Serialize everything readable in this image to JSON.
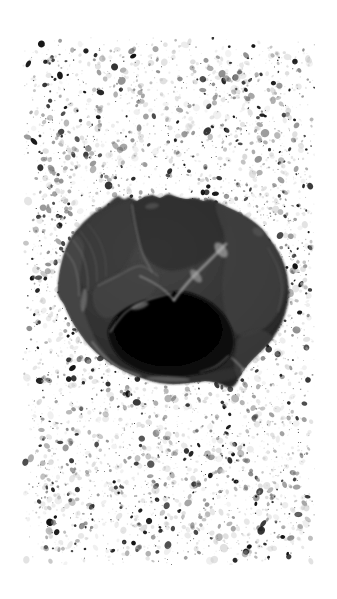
{
  "plate": {
    "kind": "scanned-photographic-plate",
    "subject": "lithic artifact",
    "caption": "",
    "title": "",
    "width": 337,
    "height": 599,
    "orientation": "portrait"
  },
  "page": {
    "background_color": "#ffffff",
    "margin_left": 22,
    "margin_top": 37,
    "margin_right": 22,
    "margin_bottom": 34
  },
  "noise": {
    "name": "scan-speckle-field",
    "x": 22,
    "y": 37,
    "width": 293,
    "height": 528,
    "seed": 20240517,
    "speck_count": 5200,
    "min_size": 0.5,
    "max_size": 3.2,
    "dark_color": "#111111",
    "mid_color": "#6a6a6a",
    "light_color": "#bdbdbd",
    "dark_fraction": 0.17,
    "mid_fraction": 0.33,
    "clump_count": 70,
    "clump_spread": 3.0,
    "clump_specks": 5
  },
  "artifact": {
    "name": "stone-core-artifact",
    "description": "dark rounded lithic core with flake scars and a deep shadowed cavity",
    "bbox": {
      "x": 58,
      "y": 194,
      "width": 232,
      "height": 196
    },
    "center": {
      "x": 174,
      "y": 292
    },
    "body_color": "#2b2b2b",
    "body_mid_color": "#3d3d3d",
    "body_light_color": "#6d6d6d",
    "highlight_color": "#a8a8a8",
    "cavity_color": "#080808",
    "edge_color": "#1a1a1a",
    "grain_seed": 771,
    "grain_count": 9000,
    "outline": [
      [
        58,
        292
      ],
      [
        59,
        276
      ],
      [
        62,
        261
      ],
      [
        66,
        248
      ],
      [
        72,
        236
      ],
      [
        80,
        226
      ],
      [
        88,
        218
      ],
      [
        97,
        211
      ],
      [
        105,
        206
      ],
      [
        112,
        200
      ],
      [
        118,
        196
      ],
      [
        124,
        199
      ],
      [
        130,
        197
      ],
      [
        137,
        201
      ],
      [
        144,
        197
      ],
      [
        152,
        195
      ],
      [
        160,
        198
      ],
      [
        168,
        194
      ],
      [
        177,
        197
      ],
      [
        186,
        199
      ],
      [
        195,
        198
      ],
      [
        203,
        201
      ],
      [
        211,
        199
      ],
      [
        219,
        203
      ],
      [
        227,
        207
      ],
      [
        236,
        211
      ],
      [
        245,
        216
      ],
      [
        254,
        222
      ],
      [
        262,
        229
      ],
      [
        269,
        238
      ],
      [
        276,
        248
      ],
      [
        282,
        259
      ],
      [
        286,
        270
      ],
      [
        288,
        281
      ],
      [
        289,
        292
      ],
      [
        288,
        303
      ],
      [
        285,
        314
      ],
      [
        281,
        325
      ],
      [
        275,
        335
      ],
      [
        268,
        344
      ],
      [
        260,
        352
      ],
      [
        252,
        360
      ],
      [
        245,
        368
      ],
      [
        240,
        376
      ],
      [
        236,
        384
      ],
      [
        230,
        388
      ],
      [
        222,
        385
      ],
      [
        214,
        382
      ],
      [
        205,
        381
      ],
      [
        196,
        382
      ],
      [
        187,
        383
      ],
      [
        178,
        384
      ],
      [
        169,
        384
      ],
      [
        160,
        383
      ],
      [
        151,
        381
      ],
      [
        142,
        378
      ],
      [
        133,
        375
      ],
      [
        124,
        371
      ],
      [
        115,
        366
      ],
      [
        106,
        360
      ],
      [
        97,
        353
      ],
      [
        89,
        345
      ],
      [
        82,
        336
      ],
      [
        75,
        326
      ],
      [
        69,
        315
      ],
      [
        64,
        304
      ],
      [
        60,
        298
      ]
    ],
    "cavity": [
      [
        108,
        330
      ],
      [
        115,
        317
      ],
      [
        126,
        308
      ],
      [
        139,
        302
      ],
      [
        152,
        298
      ],
      [
        164,
        294
      ],
      [
        176,
        291
      ],
      [
        188,
        292
      ],
      [
        199,
        296
      ],
      [
        209,
        301
      ],
      [
        218,
        308
      ],
      [
        225,
        316
      ],
      [
        230,
        325
      ],
      [
        233,
        334
      ],
      [
        234,
        343
      ],
      [
        232,
        352
      ],
      [
        227,
        360
      ],
      [
        220,
        366
      ],
      [
        211,
        371
      ],
      [
        200,
        374
      ],
      [
        188,
        376
      ],
      [
        176,
        377
      ],
      [
        164,
        376
      ],
      [
        152,
        374
      ],
      [
        141,
        371
      ],
      [
        131,
        366
      ],
      [
        122,
        360
      ],
      [
        115,
        352
      ],
      [
        110,
        342
      ]
    ],
    "facets": [
      {
        "name": "upper-left-facet",
        "tone": "#3a3a3a",
        "points": [
          [
            68,
            250
          ],
          [
            86,
            223
          ],
          [
            110,
            207
          ],
          [
            132,
            202
          ],
          [
            140,
            222
          ],
          [
            134,
            248
          ],
          [
            120,
            272
          ],
          [
            100,
            288
          ],
          [
            80,
            284
          ],
          [
            70,
            268
          ]
        ]
      },
      {
        "name": "upper-central-facet",
        "tone": "#2e2e2e",
        "points": [
          [
            133,
            202
          ],
          [
            160,
            196
          ],
          [
            190,
            198
          ],
          [
            216,
            204
          ],
          [
            228,
            224
          ],
          [
            216,
            250
          ],
          [
            192,
            266
          ],
          [
            166,
            270
          ],
          [
            145,
            256
          ],
          [
            136,
            230
          ]
        ]
      },
      {
        "name": "upper-right-facet",
        "tone": "#3f3f3f",
        "points": [
          [
            216,
            204
          ],
          [
            244,
            216
          ],
          [
            266,
            234
          ],
          [
            280,
            258
          ],
          [
            286,
            284
          ],
          [
            280,
            310
          ],
          [
            262,
            330
          ],
          [
            240,
            336
          ],
          [
            226,
            316
          ],
          [
            222,
            284
          ],
          [
            226,
            244
          ]
        ]
      },
      {
        "name": "left-margin-facet",
        "tone": "#4a4a4a",
        "points": [
          [
            58,
            292
          ],
          [
            62,
            262
          ],
          [
            74,
            236
          ],
          [
            84,
            246
          ],
          [
            80,
            278
          ],
          [
            84,
            310
          ],
          [
            96,
            340
          ],
          [
            110,
            360
          ],
          [
            96,
            356
          ],
          [
            78,
            334
          ],
          [
            64,
            310
          ]
        ]
      },
      {
        "name": "lower-rim-facet",
        "tone": "#333333",
        "points": [
          [
            100,
            356
          ],
          [
            124,
            372
          ],
          [
            154,
            381
          ],
          [
            186,
            384
          ],
          [
            216,
            383
          ],
          [
            238,
            377
          ],
          [
            246,
            364
          ],
          [
            230,
            368
          ],
          [
            198,
            374
          ],
          [
            162,
            376
          ],
          [
            128,
            370
          ],
          [
            106,
            358
          ]
        ]
      },
      {
        "name": "right-lower-facet",
        "tone": "#3c3c3c",
        "points": [
          [
            240,
            336
          ],
          [
            262,
            330
          ],
          [
            276,
            342
          ],
          [
            268,
            356
          ],
          [
            252,
            366
          ],
          [
            240,
            378
          ],
          [
            234,
            366
          ],
          [
            236,
            350
          ]
        ]
      },
      {
        "name": "central-left-facet",
        "tone": "#454545",
        "points": [
          [
            96,
            286
          ],
          [
            120,
            272
          ],
          [
            142,
            262
          ],
          [
            160,
            274
          ],
          [
            150,
            296
          ],
          [
            126,
            310
          ],
          [
            106,
            318
          ],
          [
            94,
            306
          ]
        ]
      }
    ],
    "ridges": [
      {
        "name": "main-arris",
        "tone": "#a5a5a5",
        "width": 3.0,
        "points": [
          [
            226,
            244
          ],
          [
            208,
            262
          ],
          [
            192,
            278
          ],
          [
            180,
            292
          ],
          [
            174,
            300
          ]
        ]
      },
      {
        "name": "arris-branch",
        "tone": "#8d8d8d",
        "width": 2.0,
        "points": [
          [
            174,
            300
          ],
          [
            164,
            290
          ],
          [
            152,
            282
          ],
          [
            140,
            276
          ]
        ]
      },
      {
        "name": "upper-left-arris",
        "tone": "#7a7a7a",
        "width": 1.6,
        "points": [
          [
            132,
            205
          ],
          [
            136,
            228
          ],
          [
            142,
            252
          ],
          [
            152,
            272
          ]
        ]
      },
      {
        "name": "facet-edge-left",
        "tone": "#6d6d6d",
        "width": 1.4,
        "points": [
          [
            98,
            286
          ],
          [
            118,
            276
          ],
          [
            140,
            266
          ],
          [
            158,
            276
          ]
        ]
      },
      {
        "name": "cavity-upper-edge",
        "tone": "#8a8a8a",
        "width": 1.6,
        "points": [
          [
            110,
            332
          ],
          [
            126,
            312
          ],
          [
            148,
            300
          ],
          [
            172,
            293
          ]
        ]
      },
      {
        "name": "left-scar-1",
        "tone": "#7d7d7d",
        "width": 1.2,
        "points": [
          [
            66,
            252
          ],
          [
            74,
            264
          ],
          [
            78,
            280
          ],
          [
            79,
            296
          ]
        ]
      },
      {
        "name": "left-scar-2",
        "tone": "#707070",
        "width": 1.2,
        "points": [
          [
            73,
            240
          ],
          [
            82,
            254
          ],
          [
            87,
            272
          ],
          [
            88,
            290
          ]
        ]
      },
      {
        "name": "left-scar-3",
        "tone": "#6a6a6a",
        "width": 1.0,
        "points": [
          [
            80,
            231
          ],
          [
            90,
            246
          ],
          [
            96,
            264
          ],
          [
            97,
            282
          ]
        ]
      },
      {
        "name": "left-scar-4",
        "tone": "#5f5f5f",
        "width": 1.0,
        "points": [
          [
            88,
            224
          ],
          [
            99,
            240
          ],
          [
            105,
            258
          ],
          [
            106,
            276
          ]
        ]
      },
      {
        "name": "lower-left-edge",
        "tone": "#8f8f8f",
        "width": 1.8,
        "points": [
          [
            92,
            342
          ],
          [
            104,
            356
          ],
          [
            120,
            368
          ],
          [
            140,
            376
          ]
        ]
      },
      {
        "name": "lower-right-edge",
        "tone": "#9a9a9a",
        "width": 1.6,
        "points": [
          [
            232,
            358
          ],
          [
            242,
            368
          ],
          [
            248,
            378
          ],
          [
            244,
            384
          ]
        ]
      },
      {
        "name": "right-rim-edge",
        "tone": "#5a5a5a",
        "width": 1.2,
        "points": [
          [
            268,
            248
          ],
          [
            278,
            268
          ],
          [
            282,
            290
          ],
          [
            278,
            312
          ]
        ]
      },
      {
        "name": "cavity-lower-spur",
        "tone": "#6f6f6f",
        "width": 1.2,
        "points": [
          [
            200,
            372
          ],
          [
            216,
            366
          ],
          [
            228,
            356
          ]
        ]
      }
    ],
    "highlights": [
      {
        "name": "arris-glint-top",
        "cx": 221,
        "cy": 250,
        "rx": 5,
        "ry": 9,
        "rot": -38,
        "tone": "#c4c4c4"
      },
      {
        "name": "arris-glint-mid",
        "cx": 196,
        "cy": 276,
        "rx": 4,
        "ry": 8,
        "rot": -40,
        "tone": "#b0b0b0"
      },
      {
        "name": "cavity-lip-glint",
        "cx": 140,
        "cy": 306,
        "rx": 9,
        "ry": 3,
        "rot": -18,
        "tone": "#9c9c9c"
      },
      {
        "name": "left-edge-glint",
        "cx": 84,
        "cy": 300,
        "rx": 3,
        "ry": 12,
        "rot": 6,
        "tone": "#8b8b8b"
      },
      {
        "name": "bottom-glint",
        "cx": 168,
        "cy": 379,
        "rx": 22,
        "ry": 3,
        "rot": 2,
        "tone": "#7e7e7e"
      },
      {
        "name": "upper-bump-glint",
        "cx": 152,
        "cy": 206,
        "rx": 7,
        "ry": 3,
        "rot": -8,
        "tone": "#636363"
      },
      {
        "name": "right-shoulder-glint",
        "cx": 258,
        "cy": 232,
        "rx": 6,
        "ry": 4,
        "rot": 30,
        "tone": "#5d5d5d"
      },
      {
        "name": "lower-right-glint",
        "cx": 246,
        "cy": 372,
        "rx": 5,
        "ry": 4,
        "rot": 20,
        "tone": "#9f9f9f"
      }
    ]
  },
  "labels": {
    "figure_number": "",
    "scale_bar": "",
    "footer": ""
  }
}
